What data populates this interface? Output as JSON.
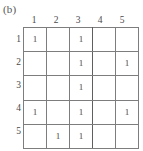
{
  "figure": {
    "caption": "(b)"
  },
  "chart_data": {
    "type": "heatmap",
    "title": "(b)",
    "xlabel": "",
    "ylabel": "",
    "grid": true,
    "legend_position": "none",
    "row_headers": [
      "1",
      "2",
      "3",
      "4",
      "5"
    ],
    "column_headers": [
      "1",
      "2",
      "3",
      "4",
      "5"
    ],
    "cell_filled_label": "1",
    "cell_empty_label": "",
    "rows": [
      [
        "1",
        "",
        "1",
        "",
        ""
      ],
      [
        "",
        "",
        "1",
        "",
        "1"
      ],
      [
        "",
        "",
        "1",
        "",
        ""
      ],
      [
        "1",
        "",
        "1",
        "",
        "1"
      ],
      [
        "",
        "1",
        "1",
        "",
        ""
      ]
    ]
  },
  "colors": {
    "grid_line": "#7d7d7d",
    "grid_line_emphasis": "#5f5f5f",
    "text": "#4a4a4a",
    "caption_text": "#555555",
    "background": "#ffffff"
  }
}
